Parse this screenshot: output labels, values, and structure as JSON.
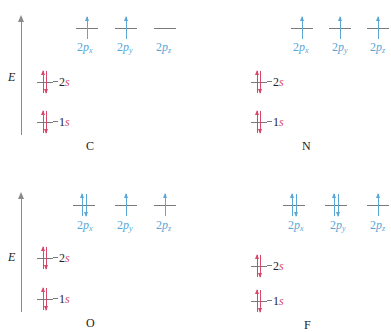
{
  "figure": {
    "axis_label": "E",
    "panels": [
      {
        "element": "C",
        "orbitals": [
          {
            "name": "1s",
            "num": "1",
            "sub": "s",
            "electrons": [
              "up",
              "down"
            ]
          },
          {
            "name": "2s",
            "num": "2",
            "sub": "s",
            "electrons": [
              "up",
              "down"
            ]
          },
          {
            "name": "2px",
            "num": "2",
            "p": "p",
            "sub": "x",
            "electrons": [
              "up"
            ]
          },
          {
            "name": "2py",
            "num": "2",
            "p": "p",
            "sub": "y",
            "electrons": [
              "up"
            ]
          },
          {
            "name": "2pz",
            "num": "2",
            "p": "p",
            "sub": "z",
            "electrons": []
          }
        ]
      },
      {
        "element": "N",
        "orbitals": [
          {
            "name": "1s",
            "num": "1",
            "sub": "s",
            "electrons": [
              "up",
              "down"
            ]
          },
          {
            "name": "2s",
            "num": "2",
            "sub": "s",
            "electrons": [
              "up",
              "down"
            ]
          },
          {
            "name": "2px",
            "num": "2",
            "p": "p",
            "sub": "x",
            "electrons": [
              "up"
            ]
          },
          {
            "name": "2py",
            "num": "2",
            "p": "p",
            "sub": "y",
            "electrons": [
              "up"
            ]
          },
          {
            "name": "2pz",
            "num": "2",
            "p": "p",
            "sub": "z",
            "electrons": [
              "up"
            ]
          }
        ]
      },
      {
        "element": "O",
        "orbitals": [
          {
            "name": "1s",
            "num": "1",
            "sub": "s",
            "electrons": [
              "up",
              "down"
            ]
          },
          {
            "name": "2s",
            "num": "2",
            "sub": "s",
            "electrons": [
              "up",
              "down"
            ]
          },
          {
            "name": "2px",
            "num": "2",
            "p": "p",
            "sub": "x",
            "electrons": [
              "up",
              "down"
            ]
          },
          {
            "name": "2py",
            "num": "2",
            "p": "p",
            "sub": "y",
            "electrons": [
              "up"
            ]
          },
          {
            "name": "2pz",
            "num": "2",
            "p": "p",
            "sub": "z",
            "electrons": [
              "up"
            ]
          }
        ]
      },
      {
        "element": "F",
        "orbitals": [
          {
            "name": "1s",
            "num": "1",
            "sub": "s",
            "electrons": [
              "up",
              "down"
            ]
          },
          {
            "name": "2s",
            "num": "2",
            "sub": "s",
            "electrons": [
              "up",
              "down"
            ]
          },
          {
            "name": "2px",
            "num": "2",
            "p": "p",
            "sub": "x",
            "electrons": [
              "up",
              "down"
            ]
          },
          {
            "name": "2py",
            "num": "2",
            "p": "p",
            "sub": "y",
            "electrons": [
              "up",
              "down"
            ]
          },
          {
            "name": "2pz",
            "num": "2",
            "p": "p",
            "sub": "z",
            "electrons": [
              "up"
            ]
          }
        ]
      }
    ],
    "colors": {
      "s_orbital": "#d9476b",
      "p_orbital": "#5aa7d6",
      "axis": "#8a8a8a",
      "level_line": "#7a7a7a"
    }
  }
}
